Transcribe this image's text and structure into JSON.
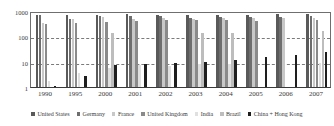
{
  "chart_data": {
    "type": "bar",
    "title": "",
    "subtitle": "",
    "xlabel": "",
    "ylabel": "",
    "yscale": "log",
    "ylim": [
      1,
      1000
    ],
    "yticks": [
      "1",
      "10",
      "100",
      "1000"
    ],
    "ytick_values": [
      1,
      10,
      100,
      1000
    ],
    "grid": "horizontal-dashed",
    "legend_position": "bottom",
    "categories": [
      "1990",
      "1995",
      "2000",
      "2001",
      "2002",
      "2003",
      "2004",
      "2005",
      "2006",
      "2007"
    ],
    "series": [
      {
        "name": "United States",
        "color": "#5a5a5a",
        "values": [
          700,
          700,
          720,
          760,
          700,
          680,
          680,
          700,
          760,
          780
        ]
      },
      {
        "name": "Germany",
        "color": "#6e6e6e",
        "values": [
          690,
          500,
          640,
          640,
          620,
          520,
          600,
          560,
          600,
          620
        ]
      },
      {
        "name": "France",
        "color": "#c8c8c8",
        "values": [
          340,
          480,
          560,
          500,
          540,
          500,
          520,
          540,
          540,
          520
        ]
      },
      {
        "name": "United Kingdom",
        "color": "#8a8a8a",
        "values": [
          310,
          330,
          370,
          400,
          430,
          450,
          450,
          420,
          null,
          430
        ]
      },
      {
        "name": "India",
        "color": "#e0e0e0",
        "values": [
          1.8,
          3.6,
          5.4,
          7.2,
          6.8,
          8.0,
          8.2,
          null,
          null,
          8.5
        ]
      },
      {
        "name": "Brazil",
        "color": "#bdbdbd",
        "values": [
          null,
          null,
          140,
          null,
          null,
          130,
          135,
          null,
          null,
          170
        ]
      },
      {
        "name": "China + Hong Kong",
        "color": "#1e1e1e",
        "values": [
          1.0,
          2.8,
          7.2,
          8.0,
          8.8,
          10.0,
          12.0,
          15.5,
          19.0,
          24.5
        ]
      }
    ]
  },
  "legend": {
    "items": [
      {
        "label": "United States"
      },
      {
        "label": "Germany"
      },
      {
        "label": "France"
      },
      {
        "label": "United Kingdom"
      },
      {
        "label": "India"
      },
      {
        "label": "Brazil"
      },
      {
        "label": "China + Hong Kong"
      }
    ]
  }
}
